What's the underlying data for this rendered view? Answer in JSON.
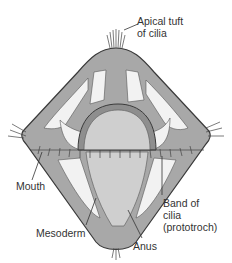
{
  "diagram": {
    "labels": {
      "apical_tuft_line1": "Apical tuft",
      "apical_tuft_line2": "of cilia",
      "mouth": "Mouth",
      "band_line1": "Band of",
      "band_line2": "cilia",
      "band_line3": "(prototroch)",
      "mesoderm": "Mesoderm",
      "anus": "Anus"
    },
    "colors": {
      "outline": "#3a3a3a",
      "body_fill": "#a8a8a8",
      "light_fill": "#f2f2f2",
      "gut_fill": "#cfcfcf",
      "text": "#333333"
    }
  }
}
